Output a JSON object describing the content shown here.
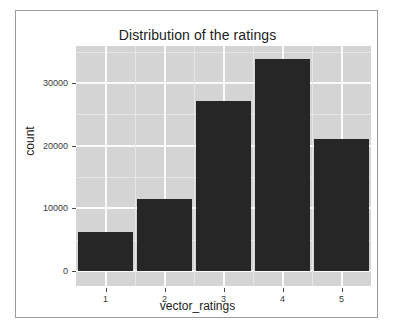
{
  "chart_data": {
    "type": "bar",
    "title": "Distribution of the ratings",
    "xlabel": "vector_ratings",
    "ylabel": "count",
    "categories": [
      "1",
      "2",
      "3",
      "4",
      "5"
    ],
    "values": [
      6270,
      11540,
      27130,
      33830,
      21060
    ],
    "ylim": [
      0,
      35900
    ],
    "y_ticks": [
      0,
      10000,
      20000,
      30000
    ],
    "y_tick_labels": [
      "0",
      "10000",
      "20000",
      "30000"
    ],
    "x_tick_labels": [
      "1",
      "2",
      "3",
      "4",
      "5"
    ],
    "grid": true,
    "grid_major_color": "#fbfbfb",
    "grid_minor_color": "#e6e6e6",
    "panel_background": "#d4d4d4",
    "bar_color": "#262626",
    "legend": null,
    "legend_position": "none",
    "figure_background": "#ffffff",
    "frame_border_color": "#9a9a9a"
  }
}
